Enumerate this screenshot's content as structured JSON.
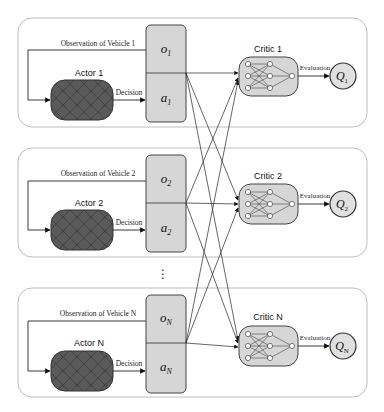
{
  "diagram": {
    "type": "multi-agent actor-critic architecture",
    "colors": {
      "panel_border": "#b8b8b8",
      "box_fill": "#d6d6d6",
      "box_border": "#555555",
      "actor_fill": "#5a5a5a",
      "line": "#222222"
    },
    "agents": [
      {
        "id": "1",
        "observation_label": "Observation of Vehicle 1",
        "actor_label": "Actor 1",
        "decision_label": "Decision",
        "obs_symbol": "o",
        "obs_sub": "1",
        "act_symbol": "a",
        "act_sub": "1",
        "critic_label": "Critic 1",
        "evaluation_label": "Evaluation",
        "q_symbol": "Q",
        "q_sub": "1"
      },
      {
        "id": "2",
        "observation_label": "Observation of Vehicle 2",
        "actor_label": "Actor 2",
        "decision_label": "Decision",
        "obs_symbol": "o",
        "obs_sub": "2",
        "act_symbol": "a",
        "act_sub": "2",
        "critic_label": "Critic 2",
        "evaluation_label": "Evaluation",
        "q_symbol": "Q",
        "q_sub": "2"
      },
      {
        "id": "N",
        "observation_label": "Observation of Vehicle N",
        "actor_label": "Actor N",
        "decision_label": "Decision",
        "obs_symbol": "o",
        "obs_sub": "N",
        "act_symbol": "a",
        "act_sub": "N",
        "critic_label": "Critic N",
        "evaluation_label": "Evaluation",
        "q_symbol": "Q",
        "q_sub": "N"
      }
    ],
    "ellipsis": "⋮"
  }
}
